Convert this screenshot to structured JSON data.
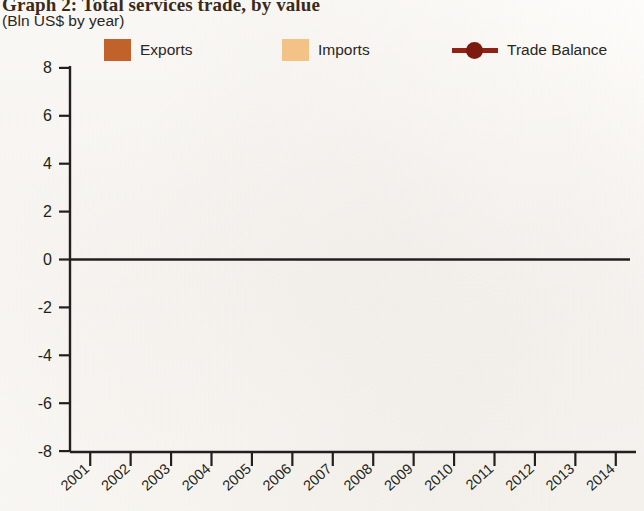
{
  "header": {
    "title": "Graph 2: Total services trade, by value",
    "subtitle": "(Bln US$ by year)"
  },
  "legend": {
    "items": [
      {
        "label": "Exports",
        "type": "swatch",
        "color": "#c0622a"
      },
      {
        "label": "Imports",
        "type": "swatch",
        "color": "#f2c286"
      },
      {
        "label": "Trade Balance",
        "type": "line",
        "color": "#8f2115"
      }
    ]
  },
  "chart_data": {
    "type": "bar",
    "title": "Graph 2: Total services trade, by value",
    "subtitle": "(Bln US$ by year)",
    "xlabel": "",
    "ylabel": "Bln US$",
    "ylim": [
      -8,
      8
    ],
    "ytick_labels": [
      "8",
      "6",
      "4",
      "2",
      "0",
      "-2",
      "-4",
      "-6",
      "-8"
    ],
    "ytick_values": [
      8,
      6,
      4,
      2,
      0,
      -2,
      -4,
      -6,
      -8
    ],
    "grid": false,
    "legend_position": "top",
    "categories": [
      "2001",
      "2002",
      "2003",
      "2004",
      "2005",
      "2006",
      "2007",
      "2008",
      "2009",
      "2010",
      "2011",
      "2012",
      "2013",
      "2014"
    ],
    "series": [
      {
        "name": "Exports",
        "color": "#c0622a",
        "values": [
          1.4,
          1.45,
          1.65,
          2.0,
          2.25,
          2.6,
          3.15,
          3.6,
          3.6,
          3.65,
          4.35,
          5.1,
          null,
          null
        ]
      },
      {
        "name": "Imports",
        "color": "#f2c286",
        "values": [
          -2.4,
          -2.45,
          -2.6,
          -2.85,
          -2.9,
          -3.3,
          -5.7,
          -4.85,
          -6.4,
          -6.6,
          -7.4,
          null,
          null,
          null
        ]
      },
      {
        "name": "Trade Balance",
        "color": "#8f2115",
        "type": "line",
        "values": [
          -1.0,
          -1.0,
          -0.9,
          -0.75,
          -0.85,
          -0.75,
          -1.2,
          -2.1,
          -1.2,
          -2.4,
          -2.2,
          -2.3,
          null,
          null
        ]
      }
    ],
    "annotations": [
      {
        "text": "(na)",
        "category": "2013",
        "position": "above-axis"
      },
      {
        "text": "(na)",
        "category": "2014",
        "position": "above-axis"
      },
      {
        "text": "(na)",
        "category": "2013",
        "position": "below-axis"
      },
      {
        "text": "(na)",
        "category": "2014",
        "position": "below-axis"
      }
    ]
  }
}
